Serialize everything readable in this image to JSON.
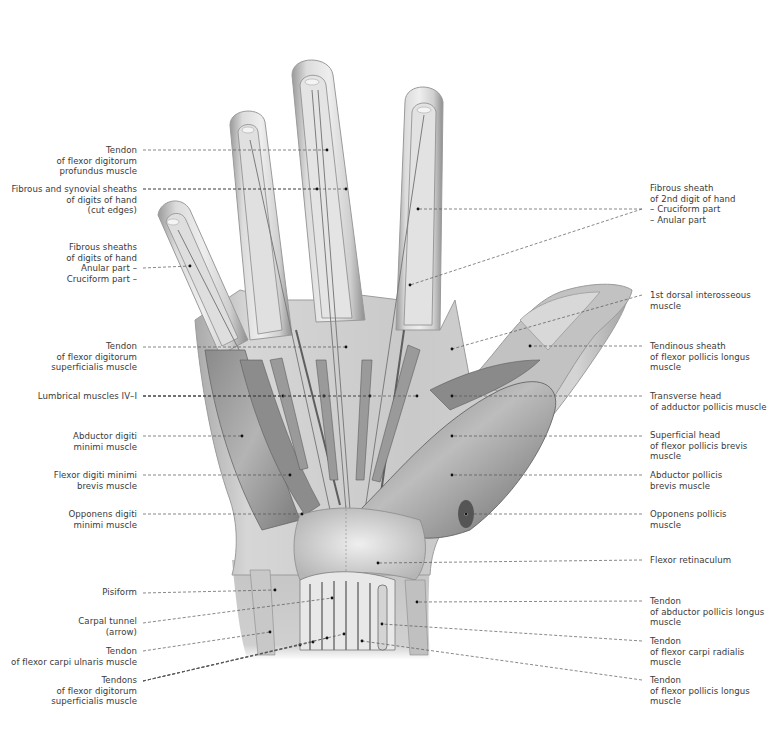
{
  "figure": {
    "background": "#ffffff",
    "colors": {
      "skin_edge": "#b8b8b8",
      "skin_fill": "#d9d9d9",
      "muscle_dark": "#6e6e6e",
      "muscle_mid": "#9a9a9a",
      "tendon_light": "#ececec",
      "leader_line": "#555555",
      "label_text": "#3a3a3a"
    }
  },
  "labels_left": [
    {
      "id": "tendon-fdp",
      "lines": [
        "Tendon",
        "of flexor digitorum",
        "profundus muscle"
      ],
      "text_right": 137,
      "top": 145,
      "line_y": 150,
      "line_x1": 143,
      "line_x2": 327,
      "dots": [
        [
          327,
          150
        ]
      ]
    },
    {
      "id": "fibrous-synovial-sheaths",
      "lines": [
        "Fibrous and synovial sheaths",
        "of digits of hand",
        "(cut edges)"
      ],
      "text_right": 137,
      "top": 184,
      "line_y": 189,
      "line_x1": 143,
      "line_x2": 346,
      "dots": [
        [
          317,
          189
        ],
        [
          346,
          189
        ]
      ]
    },
    {
      "id": "fibrous-sheaths-digits",
      "lines": [
        "Fibrous sheaths",
        "of digits of hand",
        "Anular part –",
        "Cruciform part –"
      ],
      "text_right": 137,
      "top": 242,
      "line_y": 268,
      "line_x1": 143,
      "line_x2": 190,
      "dots": [
        [
          190,
          266
        ]
      ]
    },
    {
      "id": "tendon-fds",
      "lines": [
        "Tendon",
        "of flexor digitorum",
        "superficialis muscle"
      ],
      "text_right": 137,
      "top": 341,
      "line_y": 347,
      "line_x1": 143,
      "line_x2": 346,
      "dots": [
        [
          346,
          347
        ]
      ]
    },
    {
      "id": "lumbrical-muscles",
      "lines": [
        "Lumbrical muscles IV–I"
      ],
      "text_right": 137,
      "top": 391,
      "line_y": 396,
      "line_x1": 143,
      "line_x2": 417,
      "dots": [
        [
          283,
          396
        ],
        [
          324,
          396
        ],
        [
          370,
          396
        ],
        [
          417,
          396
        ]
      ]
    },
    {
      "id": "abductor-digiti-minimi",
      "lines": [
        "Abductor digiti",
        "minimi muscle"
      ],
      "text_right": 137,
      "top": 431,
      "line_y": 436,
      "line_x1": 143,
      "line_x2": 242,
      "dots": [
        [
          242,
          436
        ]
      ]
    },
    {
      "id": "flexor-digiti-minimi-brevis",
      "lines": [
        "Flexor digiti minimi",
        "brevis muscle"
      ],
      "text_right": 137,
      "top": 470,
      "line_y": 475,
      "line_x1": 143,
      "line_x2": 290,
      "dots": [
        [
          290,
          475
        ]
      ]
    },
    {
      "id": "opponens-digiti-minimi",
      "lines": [
        "Opponens digiti",
        "minimi muscle"
      ],
      "text_right": 137,
      "top": 509,
      "line_y": 514,
      "line_x1": 143,
      "line_x2": 302,
      "dots": [
        [
          302,
          514
        ]
      ]
    },
    {
      "id": "pisiform",
      "lines": [
        "Pisiform"
      ],
      "text_right": 137,
      "top": 587,
      "line_y": 593,
      "line_x1": 143,
      "line_x2": 275,
      "dots": [
        [
          275,
          590
        ]
      ]
    },
    {
      "id": "carpal-tunnel",
      "lines": [
        "Carpal tunnel",
        "(arrow)"
      ],
      "text_right": 137,
      "top": 616,
      "line_y": 623,
      "line_x1": 143,
      "line_x2": 332,
      "dots": [
        [
          332,
          598
        ]
      ]
    },
    {
      "id": "tendon-fcu",
      "lines": [
        "Tendon",
        "of flexor carpi ulnaris muscle"
      ],
      "text_right": 137,
      "top": 646,
      "line_y": 651,
      "line_x1": 143,
      "line_x2": 270,
      "dots": [
        [
          270,
          632
        ]
      ]
    },
    {
      "id": "tendons-fds",
      "lines": [
        "Tendons",
        "of flexor digitorum",
        "superficialis muscle"
      ],
      "text_right": 137,
      "top": 675,
      "line_y": 681,
      "line_x1": 143,
      "line_x2": 344,
      "dots": [
        [
          300,
          645
        ],
        [
          313,
          642
        ],
        [
          327,
          638
        ],
        [
          344,
          634
        ]
      ]
    }
  ],
  "labels_right": [
    {
      "id": "fibrous-sheath-2nd-digit",
      "lines": [
        "Fibrous sheath",
        "of 2nd digit of hand",
        "– Cruciform part",
        "– Anular part"
      ],
      "text_left": 650,
      "top": 183,
      "line_y": 209,
      "line_x1": 418,
      "line_x2": 642,
      "dots": [
        [
          418,
          209
        ],
        [
          410,
          285
        ]
      ]
    },
    {
      "id": "first-dorsal-interosseous",
      "lines": [
        "1st dorsal interosseous",
        "muscle"
      ],
      "text_left": 650,
      "top": 290,
      "line_y": 295,
      "line_x1": 452,
      "line_x2": 642,
      "dots": [
        [
          452,
          349
        ]
      ]
    },
    {
      "id": "tendinous-sheath-fpl",
      "lines": [
        "Tendinous sheath",
        "of flexor pollicis longus",
        "muscle"
      ],
      "text_left": 650,
      "top": 341,
      "line_y": 346,
      "line_x1": 530,
      "line_x2": 642,
      "dots": [
        [
          530,
          346
        ]
      ]
    },
    {
      "id": "transverse-head-adductor",
      "lines": [
        "Transverse head",
        "of adductor pollicis muscle"
      ],
      "text_left": 650,
      "top": 391,
      "line_y": 396,
      "line_x1": 452,
      "line_x2": 642,
      "dots": [
        [
          452,
          396
        ]
      ]
    },
    {
      "id": "superficial-head-fpb",
      "lines": [
        "Superficial head",
        "of flexor pollicis brevis",
        "muscle"
      ],
      "text_left": 650,
      "top": 430,
      "line_y": 436,
      "line_x1": 452,
      "line_x2": 642,
      "dots": [
        [
          452,
          436
        ]
      ]
    },
    {
      "id": "abductor-pollicis-brevis",
      "lines": [
        "Abductor pollicis",
        "brevis muscle"
      ],
      "text_left": 650,
      "top": 470,
      "line_y": 475,
      "line_x1": 452,
      "line_x2": 642,
      "dots": [
        [
          452,
          475
        ]
      ]
    },
    {
      "id": "opponens-pollicis",
      "lines": [
        "Opponens pollicis",
        "muscle"
      ],
      "text_left": 650,
      "top": 509,
      "line_y": 514,
      "line_x1": 466,
      "line_x2": 642,
      "dots": [
        [
          466,
          514
        ]
      ]
    },
    {
      "id": "flexor-retinaculum",
      "lines": [
        "Flexor retinaculum"
      ],
      "text_left": 650,
      "top": 555,
      "line_y": 560,
      "line_x1": 378,
      "line_x2": 642,
      "dots": [
        [
          378,
          563
        ]
      ]
    },
    {
      "id": "tendon-apl",
      "lines": [
        "Tendon",
        "of abductor pollicis longus",
        "muscle"
      ],
      "text_left": 650,
      "top": 596,
      "line_y": 601,
      "line_x1": 417,
      "line_x2": 642,
      "dots": [
        [
          417,
          602
        ]
      ]
    },
    {
      "id": "tendon-fcr",
      "lines": [
        "Tendon",
        "of flexor carpi radialis",
        "muscle"
      ],
      "text_left": 650,
      "top": 636,
      "line_y": 641,
      "line_x1": 382,
      "line_x2": 642,
      "dots": [
        [
          382,
          624
        ]
      ]
    },
    {
      "id": "tendon-fpl",
      "lines": [
        "Tendon",
        "of flexor pollicis longus",
        "muscle"
      ],
      "text_left": 650,
      "top": 675,
      "line_y": 680,
      "line_x1": 362,
      "line_x2": 642,
      "dots": [
        [
          362,
          641
        ]
      ]
    }
  ]
}
